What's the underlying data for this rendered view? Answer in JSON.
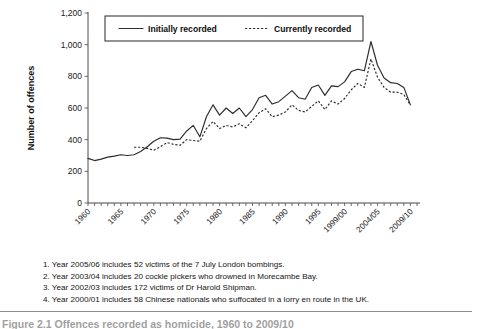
{
  "figure": {
    "caption_partial": "Figure 2.1  Offences recorded as homicide, 1960 to 2009/10"
  },
  "legend": {
    "position": "top-center-inside",
    "entries": [
      {
        "label": "Initially recorded",
        "style": "solid"
      },
      {
        "label": "Currently recorded",
        "style": "dashed"
      }
    ]
  },
  "notes": [
    "1. Year 2005/06 includes 52 victims of the 7 July London bombings.",
    "2. Year 2003/04 includes 20 cockle pickers who drowned in Morecambe Bay.",
    "3. Year 2002/03 includes 172 victims of Dr Harold Shipman.",
    "4. Year 2000/01 includes 58 Chinese nationals who suffocated in a lorry en route in the UK."
  ],
  "chart_data": {
    "type": "line",
    "title": "",
    "xlabel": "",
    "ylabel": "Number of offences",
    "ylim": [
      0,
      1200
    ],
    "yticks": [
      0,
      200,
      400,
      600,
      800,
      1000,
      1200
    ],
    "ytick_labels": [
      "0",
      "200",
      "400",
      "600",
      "800",
      "1,000",
      "1,200"
    ],
    "xlim": [
      1960,
      2010
    ],
    "xticks": [
      1960,
      1965,
      1970,
      1975,
      1980,
      1985,
      1990,
      1995,
      1999,
      2004,
      2009
    ],
    "xtick_labels": [
      "1960",
      "1965",
      "1970",
      "1975",
      "1980",
      "1985",
      "1990",
      "1995",
      "1999/00",
      "2004/05",
      "2009/10"
    ],
    "minor_tick_interval": 1,
    "grid": false,
    "x": [
      1960,
      1961,
      1962,
      1963,
      1964,
      1965,
      1966,
      1967,
      1968,
      1969,
      1970,
      1971,
      1972,
      1973,
      1974,
      1975,
      1976,
      1977,
      1978,
      1979,
      1980,
      1981,
      1982,
      1983,
      1984,
      1985,
      1986,
      1987,
      1988,
      1989,
      1990,
      1991,
      1992,
      1993,
      1994,
      1995,
      1996,
      1997,
      1998,
      1999,
      2000,
      2001,
      2002,
      2003,
      2004,
      2005,
      2006,
      2007,
      2008,
      2009
    ],
    "series": [
      {
        "name": "Initially recorded",
        "style": "solid",
        "values": [
          282,
          268,
          277,
          290,
          296,
          305,
          300,
          305,
          325,
          355,
          390,
          412,
          410,
          400,
          403,
          455,
          490,
          418,
          545,
          620,
          555,
          600,
          565,
          600,
          545,
          590,
          665,
          680,
          625,
          640,
          675,
          710,
          665,
          655,
          730,
          745,
          680,
          740,
          735,
          765,
          830,
          845,
          835,
          1020,
          870,
          790,
          760,
          755,
          730,
          620
        ]
      },
      {
        "name": "Currently recorded",
        "style": "dashed",
        "values": [
          null,
          null,
          null,
          null,
          null,
          null,
          null,
          352,
          352,
          345,
          333,
          355,
          382,
          370,
          365,
          400,
          395,
          390,
          470,
          515,
          470,
          490,
          480,
          500,
          475,
          520,
          570,
          595,
          545,
          555,
          575,
          620,
          585,
          575,
          610,
          645,
          590,
          645,
          625,
          660,
          715,
          755,
          730,
          910,
          795,
          730,
          700,
          700,
          685,
          618
        ]
      }
    ]
  }
}
